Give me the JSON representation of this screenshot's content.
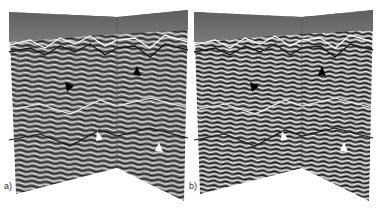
{
  "figure": {
    "panels": [
      {
        "label": "a)",
        "arrows": [
          {
            "color": "#000000"
          },
          {
            "color": "#000000"
          },
          {
            "color": "#ffffff"
          },
          {
            "color": "#ffffff"
          }
        ]
      },
      {
        "label": "b)",
        "arrows": [
          {
            "color": "#000000"
          },
          {
            "color": "#000000"
          },
          {
            "color": "#ffffff"
          },
          {
            "color": "#ffffff"
          }
        ]
      }
    ],
    "colors": {
      "water": "#6b6b6b",
      "reflector_dark": "#2a2a2a",
      "reflector_light": "#e8e8e8",
      "mid": "#7a7a7a"
    }
  }
}
